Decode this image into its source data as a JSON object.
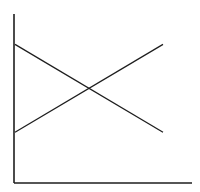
{
  "chart_data": {
    "type": "line",
    "title": "",
    "xlabel": "",
    "ylabel": "",
    "x": [
      0,
      1
    ],
    "categories": [
      "start",
      "end"
    ],
    "series": [
      {
        "name": "Line A (descending)",
        "values": [
          82,
          30
        ],
        "color": "#1e1e1e"
      },
      {
        "name": "Line B (ascending)",
        "values": [
          30,
          82
        ],
        "color": "#1e1e1e"
      }
    ],
    "ylim": [
      0,
      100
    ],
    "xlim": [
      0,
      1.2
    ],
    "grid": false,
    "legend": "none",
    "tick_labels": false,
    "annotations": []
  },
  "layout": {
    "plot": {
      "left": 14,
      "right": 192,
      "top": 14,
      "bottom": 183
    },
    "line_x_start": 15,
    "line_x_end": 163
  }
}
